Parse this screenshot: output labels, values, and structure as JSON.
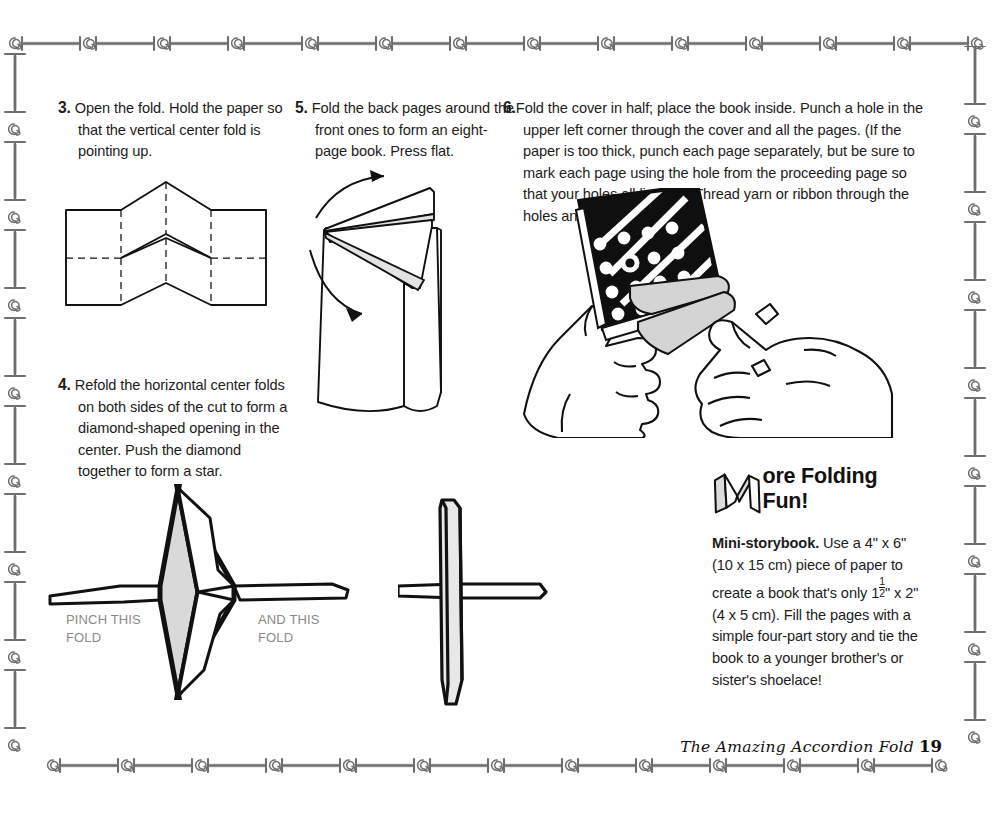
{
  "page": {
    "width": 1002,
    "height": 815,
    "background": "#ffffff",
    "ink": "#1c1c1c",
    "callout_color": "#8a8a8a",
    "border_color": "#6e6e6e"
  },
  "steps": [
    {
      "id": "step3",
      "number": "3.",
      "text": "Open the fold. Hold the paper so that the vertical center fold is pointing up."
    },
    {
      "id": "step5",
      "number": "5.",
      "text": "Fold the back pages around the front ones to form an eight-page book. Press flat."
    },
    {
      "id": "step6",
      "number": "6.",
      "text": "Fold the cover in half; place the book inside. Punch a hole in the upper left corner through the cover and all the pages. (If the paper is too thick, punch each page separately, but be sure to mark each page using the hole from the proceeding page so that your holes all line up.) Thread yarn or ribbon through the holes and knot the ends."
    },
    {
      "id": "step4",
      "number": "4.",
      "text": "Refold the horizontal center folds on both sides of the cut to form a diamond-shaped opening in the center. Push the diamond together to form a star."
    }
  ],
  "callouts": {
    "pinch": "PINCH THIS\nFOLD",
    "pinch_line1": "PINCH THIS",
    "pinch_line2": "FOLD",
    "and_line1": "AND THIS",
    "and_line2": "FOLD"
  },
  "more_folding_fun": {
    "drop_cap": "M",
    "title": "ore Folding Fun!",
    "entry_label": "Mini-storybook.",
    "body_part1": " Use a 4\" x 6\" (10 x 15 cm) piece of paper to create a book that's only 1",
    "fraction_numerator": "1",
    "fraction_denominator": "2",
    "body_part2": "\" x 2\" (4 x 5 cm). Fill the pages with a simple four-part story and tie the book to a younger brother's or sister's shoelace!"
  },
  "footer": {
    "chapter": "The Amazing Accordion Fold",
    "page_number": "19"
  },
  "figures": [
    {
      "id": "fig-accordion",
      "name": "accordion-fold-paper-diagram",
      "caption_step": "3"
    },
    {
      "id": "fig-book",
      "name": "eight-page-book-diagram",
      "caption_step": "5"
    },
    {
      "id": "fig-hands",
      "name": "hands-holding-punched-book-illustration",
      "caption_step": "6"
    },
    {
      "id": "fig-star",
      "name": "diamond-star-fold-diagram",
      "caption_step": "4"
    },
    {
      "id": "fig-cross",
      "name": "pinched-star-cross-diagram",
      "caption_step": "4"
    }
  ],
  "decoration": {
    "border_motif": "spiral-and-bar-rule",
    "top_border": "spiral-bar-repeat",
    "bottom_border": "spiral-bar-repeat",
    "left_border": "ibeam-spiral-repeat",
    "right_border": "ibeam-spiral-repeat"
  }
}
